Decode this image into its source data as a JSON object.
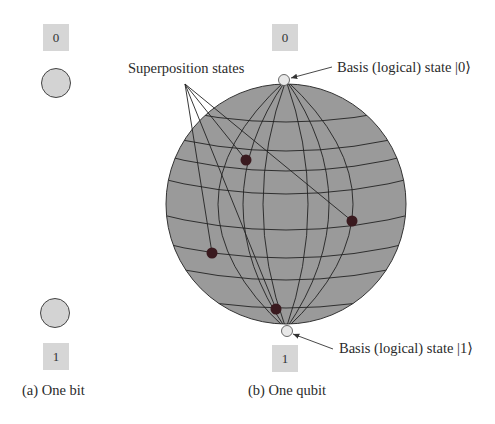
{
  "bit_panel": {
    "top_label": "0",
    "bottom_label": "1",
    "caption": "(a) One bit"
  },
  "qubit_panel": {
    "top_label": "0",
    "bottom_label": "1",
    "caption": "(b) One qubit",
    "superposition_label": "Superposition states",
    "basis0_label": "Basis (logical) state |0⟩",
    "basis1_label": "Basis (logical) state |1⟩"
  },
  "colors": {
    "sphere_fill": "#9a9a9a",
    "bit_circle_fill": "#d3d3d3",
    "label_box_fill": "#d6d6d6",
    "state_dot": "#3a1a1f",
    "pole_dot": "#e8e8e8"
  }
}
